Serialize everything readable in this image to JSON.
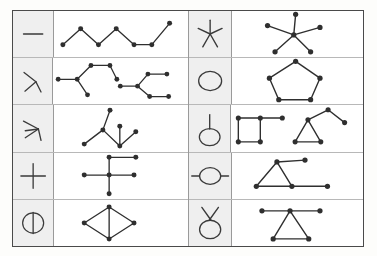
{
  "figure": {
    "kind": "symbol-graph-correspondence-table",
    "columns": 4,
    "rows_per_half": 5,
    "colors": {
      "glyph_cell_background": "#efefef",
      "graph_cell_background": "#ffffff",
      "stroke": "#3a3a3a",
      "node_fill": "#2f2f2f",
      "outer_border": "#4a4a4a",
      "inner_border": "#b8b8b8"
    }
  },
  "left_half": {
    "rows": [
      {
        "glyph": {
          "name": "horizontal-dash-glyph",
          "label": "—"
        },
        "graph": {
          "name": "zigzag-path-graph",
          "node_count": 7,
          "edge_count": 6,
          "nodes": [
            [
              8,
              34
            ],
            [
              28,
              14
            ],
            [
              48,
              34
            ],
            [
              68,
              14
            ],
            [
              88,
              34
            ],
            [
              108,
              16
            ],
            [
              128,
              6
            ]
          ],
          "edges": [
            [
              0,
              1
            ],
            [
              1,
              2
            ],
            [
              2,
              3
            ],
            [
              3,
              4
            ],
            [
              4,
              5
            ],
            [
              5,
              6
            ]
          ]
        }
      },
      {
        "glyph": {
          "name": "rotated-y-glyph",
          "label": "⅄"
        },
        "graph": {
          "name": "two-tree-graphs",
          "node_count": 14,
          "edge_count": 12,
          "nodes": [
            [
              6,
              22
            ],
            [
              26,
              22
            ],
            [
              40,
              6
            ],
            [
              62,
              6
            ],
            [
              70,
              22
            ],
            [
              38,
              40
            ],
            [
              78,
              30
            ],
            [
              96,
              30
            ],
            [
              104,
              16
            ],
            [
              126,
              14
            ],
            [
              124,
              40
            ],
            [
              144,
              40
            ],
            [
              118,
              4
            ],
            [
              60,
              38
            ]
          ],
          "edges": [
            [
              0,
              1
            ],
            [
              1,
              2
            ],
            [
              2,
              3
            ],
            [
              3,
              4
            ],
            [
              1,
              5
            ],
            [
              6,
              7
            ],
            [
              7,
              8
            ],
            [
              8,
              9
            ],
            [
              7,
              10
            ],
            [
              10,
              11
            ]
          ]
        }
      },
      {
        "glyph": {
          "name": "rotated-psi-glyph",
          "label": "⸟"
        },
        "graph": {
          "name": "y-and-v-tree-graph",
          "node_count": 7,
          "edge_count": 6,
          "nodes": [
            [
              56,
              4
            ],
            [
              46,
              26
            ],
            [
              28,
              40
            ],
            [
              68,
              40
            ],
            [
              68,
              20
            ],
            [
              86,
              24
            ],
            [
              46,
              26
            ]
          ],
          "edges": [
            [
              0,
              1
            ],
            [
              1,
              2
            ],
            [
              1,
              3
            ],
            [
              3,
              4
            ],
            [
              3,
              5
            ]
          ]
        }
      },
      {
        "glyph": {
          "name": "plus-glyph",
          "label": "+"
        },
        "graph": {
          "name": "cross-star-graph",
          "node_count": 6,
          "edge_count": 5,
          "nodes": [
            [
              56,
              24
            ],
            [
              26,
              24
            ],
            [
              84,
              24
            ],
            [
              56,
              4
            ],
            [
              86,
              4
            ],
            [
              56,
              46
            ]
          ],
          "edges": [
            [
              0,
              1
            ],
            [
              0,
              2
            ],
            [
              0,
              3
            ],
            [
              3,
              4
            ],
            [
              0,
              5
            ]
          ]
        }
      },
      {
        "glyph": {
          "name": "circle-with-vertical-line-glyph",
          "label": "⨀"
        },
        "graph": {
          "name": "diamond-cycle-graph",
          "node_count": 5,
          "edge_count": 5,
          "nodes": [
            [
              56,
              4
            ],
            [
              30,
              22
            ],
            [
              82,
              22
            ],
            [
              56,
              40
            ],
            [
              56,
              22
            ]
          ],
          "edges": [
            [
              0,
              1
            ],
            [
              0,
              2
            ],
            [
              1,
              3
            ],
            [
              2,
              3
            ],
            [
              0,
              3
            ]
          ]
        }
      }
    ]
  },
  "right_half": {
    "rows": [
      {
        "glyph": {
          "name": "asterisk-star-glyph",
          "label": "✳"
        },
        "graph": {
          "name": "five-spoke-star-graph",
          "node_count": 6,
          "edge_count": 5,
          "nodes": [
            [
              56,
              24
            ],
            [
              56,
              2
            ],
            [
              26,
              16
            ],
            [
              86,
              16
            ],
            [
              36,
              44
            ],
            [
              76,
              44
            ]
          ],
          "edges": [
            [
              0,
              1
            ],
            [
              0,
              2
            ],
            [
              0,
              3
            ],
            [
              0,
              4
            ],
            [
              0,
              5
            ]
          ]
        }
      },
      {
        "glyph": {
          "name": "circle-glyph",
          "label": "○"
        },
        "graph": {
          "name": "pentagon-cycle-graph",
          "node_count": 5,
          "edge_count": 5,
          "nodes": [
            [
              56,
              2
            ],
            [
              26,
              22
            ],
            [
              38,
              48
            ],
            [
              74,
              48
            ],
            [
              86,
              22
            ]
          ],
          "edges": [
            [
              0,
              1
            ],
            [
              1,
              2
            ],
            [
              2,
              3
            ],
            [
              3,
              4
            ],
            [
              4,
              0
            ]
          ]
        }
      },
      {
        "glyph": {
          "name": "circle-with-stem-glyph",
          "label": "♀"
        },
        "graph": {
          "name": "square-plus-triangle-graphs",
          "node_count": 10,
          "edge_count": 10,
          "nodes": [
            [
              6,
              12
            ],
            [
              30,
              12
            ],
            [
              54,
              12
            ],
            [
              6,
              38
            ],
            [
              30,
              38
            ],
            [
              82,
              12
            ],
            [
              68,
              38
            ],
            [
              96,
              38
            ],
            [
              104,
              2
            ],
            [
              124,
              16
            ]
          ],
          "edges": [
            [
              0,
              1
            ],
            [
              1,
              2
            ],
            [
              0,
              3
            ],
            [
              3,
              4
            ],
            [
              4,
              1
            ],
            [
              5,
              6
            ],
            [
              6,
              7
            ],
            [
              7,
              5
            ],
            [
              5,
              8
            ],
            [
              8,
              9
            ]
          ]
        }
      },
      {
        "glyph": {
          "name": "circle-with-side-lines-glyph",
          "label": "⦵"
        },
        "graph": {
          "name": "triangle-with-tails-graph",
          "node_count": 5,
          "edge_count": 5,
          "nodes": [
            [
              46,
              6
            ],
            [
              24,
              32
            ],
            [
              62,
              32
            ],
            [
              76,
              6
            ],
            [
              104,
              32
            ]
          ],
          "edges": [
            [
              0,
              1
            ],
            [
              0,
              2
            ],
            [
              1,
              2
            ],
            [
              0,
              3
            ],
            [
              2,
              4
            ]
          ]
        }
      },
      {
        "glyph": {
          "name": "circle-with-antenna-glyph",
          "label": "♇"
        },
        "graph": {
          "name": "triangle-with-crossbar-graph",
          "node_count": 5,
          "edge_count": 5,
          "nodes": [
            [
              56,
              10
            ],
            [
              24,
              10
            ],
            [
              88,
              10
            ],
            [
              36,
              40
            ],
            [
              76,
              40
            ]
          ],
          "edges": [
            [
              0,
              1
            ],
            [
              0,
              2
            ],
            [
              0,
              3
            ],
            [
              0,
              4
            ],
            [
              3,
              4
            ]
          ]
        }
      }
    ]
  }
}
